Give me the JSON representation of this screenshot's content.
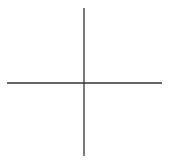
{
  "diagram": {
    "type": "crosshair",
    "width": 170,
    "height": 162,
    "background": "#ffffff",
    "stroke_color": "#333333",
    "stroke_width": 1.3,
    "horizontal_axis": {
      "x1": 7,
      "y1": 83,
      "x2": 162,
      "y2": 83
    },
    "vertical_axis": {
      "x1": 84,
      "y1": 8,
      "x2": 84,
      "y2": 156
    },
    "intersection": {
      "x": 84,
      "y": 83
    }
  }
}
